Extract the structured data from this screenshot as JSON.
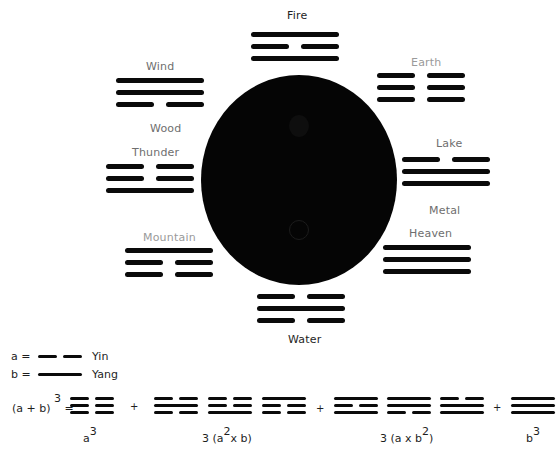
{
  "diagram": {
    "center": {
      "shape": "yin-yang circle",
      "color": "#050505"
    },
    "trigrams": [
      {
        "id": "fire",
        "label": "Fire",
        "lines": [
          1,
          0,
          1
        ],
        "label_color": "dark"
      },
      {
        "id": "wind",
        "label": "Wind",
        "lines": [
          1,
          1,
          0
        ],
        "label_color": "grey"
      },
      {
        "id": "earth",
        "label": "Earth",
        "lines": [
          0,
          0,
          0
        ],
        "label_color": "light"
      },
      {
        "id": "thunder",
        "label": "Thunder",
        "lines": [
          0,
          0,
          1
        ],
        "label_color": "grey"
      },
      {
        "id": "lake",
        "label": "Lake",
        "lines": [
          0,
          1,
          1
        ],
        "label_color": "grey"
      },
      {
        "id": "heaven",
        "label": "Heaven",
        "lines": [
          1,
          1,
          1
        ],
        "label_color": "grey"
      },
      {
        "id": "mountain",
        "label": "Mountain",
        "lines": [
          1,
          0,
          0
        ],
        "label_color": "light"
      },
      {
        "id": "water",
        "label": "Water",
        "lines": [
          0,
          1,
          0
        ],
        "label_color": "dark"
      }
    ],
    "element_labels": {
      "wood": "Wood",
      "metal": "Metal"
    },
    "legend": {
      "a_label": "a =",
      "a_name": "Yin",
      "b_label": "b =",
      "b_name": "Yang"
    },
    "equation": {
      "lhs": "(a + b)",
      "lhs_exp": "3",
      "equals": "=",
      "plus": "+",
      "groups": [
        {
          "id": "a3",
          "trigrams": [
            [
              0,
              0,
              0
            ]
          ],
          "caption_base": "a",
          "caption_sup": "3",
          "caption_tail": ""
        },
        {
          "id": "3a2b",
          "trigrams": [
            [
              0,
              1,
              0
            ],
            [
              0,
              0,
              1
            ],
            [
              1,
              0,
              0
            ]
          ],
          "caption_base": "3 (a",
          "caption_sup": "2",
          "caption_tail": "x  b)"
        },
        {
          "id": "3ab2",
          "trigrams": [
            [
              1,
              0,
              1
            ],
            [
              1,
              1,
              0
            ],
            [
              0,
              1,
              1
            ]
          ],
          "caption_base": "3 (a x b",
          "caption_sup": "2",
          "caption_tail": ")"
        },
        {
          "id": "b3",
          "trigrams": [
            [
              1,
              1,
              1
            ]
          ],
          "caption_base": "b",
          "caption_sup": "3",
          "caption_tail": ""
        }
      ]
    }
  }
}
